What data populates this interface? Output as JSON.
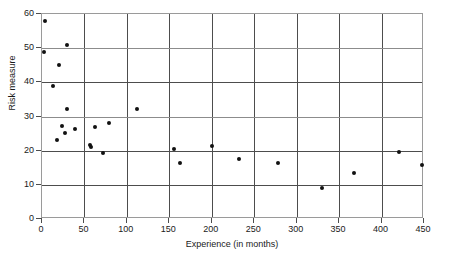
{
  "chart_data": {
    "type": "scatter",
    "title": "",
    "xlabel": "Experience (in months)",
    "ylabel": "Risk measure",
    "xlim": [
      0,
      450
    ],
    "ylim": [
      0,
      60
    ],
    "xticks": [
      0,
      50,
      100,
      150,
      200,
      250,
      300,
      350,
      400,
      450
    ],
    "yticks": [
      0,
      10,
      20,
      30,
      40,
      50,
      60
    ],
    "xtick_labels": [
      "0",
      "50",
      "100",
      "150",
      "200",
      "250",
      "300",
      "350",
      "400",
      "450"
    ],
    "ytick_labels": [
      "0",
      "10",
      "20",
      "30",
      "40",
      "50",
      "60"
    ],
    "grid": true,
    "grid_axes": "both",
    "legend": null,
    "marker": "filled-circle",
    "marker_color": "#111111",
    "points": [
      {
        "x": 4,
        "y": 58.0
      },
      {
        "x": 2,
        "y": 49.0
      },
      {
        "x": 20,
        "y": 45.0
      },
      {
        "x": 13,
        "y": 39.0
      },
      {
        "x": 29,
        "y": 51.0
      },
      {
        "x": 29,
        "y": 32.2
      },
      {
        "x": 24,
        "y": 27.2
      },
      {
        "x": 27,
        "y": 25.3
      },
      {
        "x": 18,
        "y": 23.0
      },
      {
        "x": 39,
        "y": 26.2
      },
      {
        "x": 57,
        "y": 21.8
      },
      {
        "x": 58,
        "y": 21.2
      },
      {
        "x": 72,
        "y": 19.3
      },
      {
        "x": 62,
        "y": 27.0
      },
      {
        "x": 79,
        "y": 28.0
      },
      {
        "x": 112,
        "y": 32.3
      },
      {
        "x": 156,
        "y": 20.4
      },
      {
        "x": 162,
        "y": 16.3
      },
      {
        "x": 200,
        "y": 21.3
      },
      {
        "x": 232,
        "y": 17.5
      },
      {
        "x": 278,
        "y": 16.4
      },
      {
        "x": 330,
        "y": 9.2
      },
      {
        "x": 368,
        "y": 13.4
      },
      {
        "x": 420,
        "y": 19.6
      },
      {
        "x": 448,
        "y": 15.8
      }
    ]
  },
  "colors": {
    "marker": "#111111",
    "grid": "#4d4d4d",
    "frame": "#9a9a9a",
    "text": "#1a1a1a",
    "background": "#ffffff"
  }
}
